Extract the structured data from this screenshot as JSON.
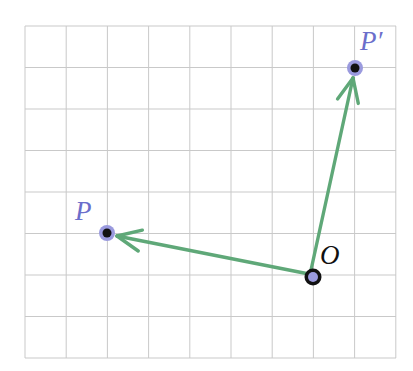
{
  "figure": {
    "background_color": "#ffffff",
    "grid": {
      "line_color": "#c9c9c9",
      "line_width": 1,
      "origin_x": 25,
      "origin_y": 26,
      "cell_width": 41.2,
      "cell_height": 41.5,
      "columns": 9,
      "rows": 8,
      "right": 396,
      "bottom": 358
    },
    "accent_colors": {
      "vector_green": "#5fa878",
      "point_blue": "#9a9ade",
      "point_black": "#111111",
      "label_blue": "#6b6ecb",
      "label_black": "#101010"
    },
    "points": [
      {
        "id": "P",
        "label": "P",
        "label_color": "#6b6ecb",
        "x": 107,
        "y": 233,
        "outer_radius": 8,
        "inner_radius": 4.5,
        "outer_color": "#9a9ade",
        "inner_color": "#111111"
      },
      {
        "id": "Pprime",
        "label": "P′",
        "label_color": "#6b6ecb",
        "x": 355,
        "y": 68,
        "outer_radius": 8,
        "inner_radius": 4.5,
        "outer_color": "#9a9ade",
        "inner_color": "#111111"
      },
      {
        "id": "O",
        "label": "O",
        "label_color": "#101010",
        "x": 313,
        "y": 277,
        "outer_radius": 8.5,
        "inner_radius": 5,
        "outer_color": "#111111",
        "inner_color": "#9a9ade"
      }
    ],
    "vectors": [
      {
        "id": "OP",
        "name": "vector-O-to-P",
        "from": "O",
        "to": "P",
        "from_x": 309,
        "from_y": 274,
        "to_x": 117,
        "to_y": 236,
        "color": "#5fa878",
        "stroke_width": 3.4,
        "arrowhead": "open-v"
      },
      {
        "id": "OPprime",
        "name": "vector-O-to-P-prime",
        "from": "O",
        "to": "Pprime",
        "from_x": 311,
        "from_y": 270,
        "to_x": 353,
        "to_y": 78,
        "color": "#5fa878",
        "stroke_width": 3.4,
        "arrowhead": "open-v"
      }
    ]
  }
}
